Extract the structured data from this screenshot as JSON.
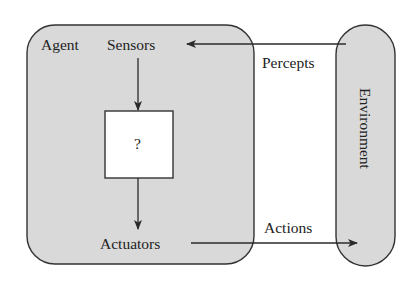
{
  "diagram": {
    "type": "agent-environment",
    "agent": {
      "label": "Agent",
      "sensors_label": "Sensors",
      "actuators_label": "Actuators",
      "internal_box_label": "?"
    },
    "environment": {
      "label": "Environment"
    },
    "edges": [
      {
        "from": "environment",
        "to": "sensors",
        "label": "Percepts"
      },
      {
        "from": "sensors",
        "to": "internal_box",
        "label": ""
      },
      {
        "from": "internal_box",
        "to": "actuators",
        "label": ""
      },
      {
        "from": "actuators",
        "to": "environment",
        "label": "Actions"
      }
    ],
    "colors": {
      "fill": "#d9d9d9",
      "stroke": "#333333",
      "box_fill": "#ffffff",
      "background": "#ffffff"
    }
  }
}
